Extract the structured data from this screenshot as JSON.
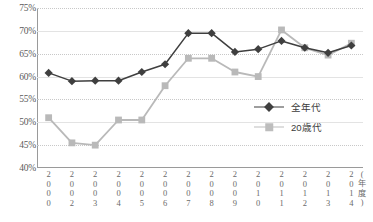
{
  "chart_data": {
    "type": "line",
    "title": "",
    "xlabel": "(年度)",
    "ylabel": "",
    "ylim": [
      40,
      75
    ],
    "ystep": 5,
    "grid": true,
    "legend_position": "inside-right",
    "categories": [
      "2000",
      "2002",
      "2003",
      "2004",
      "2005",
      "2006",
      "2007",
      "2008",
      "2009",
      "2010",
      "2011",
      "2012",
      "2013",
      "2014"
    ],
    "ytick_labels": [
      "75%",
      "70%",
      "65%",
      "60%",
      "55%",
      "50%",
      "45%",
      "40%"
    ],
    "ytick_values": [
      75,
      70,
      65,
      60,
      55,
      50,
      45,
      40
    ],
    "series": [
      {
        "name": "全年代",
        "color": "#3f3f3f",
        "marker": "diamond",
        "values": [
          60.8,
          59.0,
          59.1,
          59.1,
          61.0,
          62.7,
          69.5,
          69.5,
          65.4,
          66.0,
          67.8,
          66.3,
          65.2,
          66.8
        ]
      },
      {
        "name": "20歳代",
        "color": "#b9b9b9",
        "marker": "square",
        "values": [
          51.0,
          45.5,
          45.0,
          50.5,
          50.5,
          58.0,
          64.0,
          64.0,
          61.0,
          60.0,
          70.2,
          66.3,
          64.7,
          67.3
        ]
      }
    ]
  },
  "legend": {
    "items": [
      {
        "label": "全年代"
      },
      {
        "label": "20歳代"
      }
    ]
  }
}
